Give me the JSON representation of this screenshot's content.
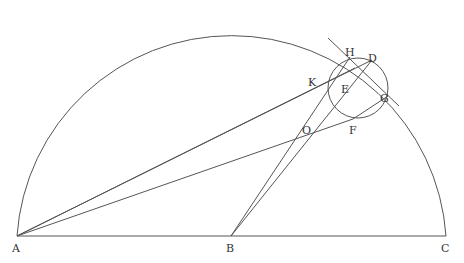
{
  "diagram": {
    "colors": {
      "stroke": "#555555",
      "label": "#333333",
      "background": "#ffffff"
    },
    "labels": {
      "A": "A",
      "B": "B",
      "C": "C",
      "D": "D",
      "E": "E",
      "F": "F",
      "G": "G",
      "H": "H",
      "K": "K",
      "O": "O"
    },
    "points": {
      "A": [
        17,
        236
      ],
      "B": [
        231,
        236
      ],
      "C": [
        446,
        236
      ],
      "D": [
        372,
        60
      ],
      "E": [
        346,
        88
      ],
      "F": [
        353,
        119
      ],
      "G": [
        388,
        96
      ],
      "H": [
        350,
        57
      ],
      "K": [
        330,
        80
      ],
      "O": [
        310,
        133
      ]
    },
    "semicircle": {
      "center": "B",
      "radius": 215
    },
    "small_circle": {
      "center": [
        358,
        88
      ],
      "radius": 30
    },
    "segments": [
      [
        "A",
        "C"
      ],
      [
        "A",
        "D"
      ],
      [
        "A",
        "K"
      ],
      [
        "A",
        "F"
      ],
      [
        "B",
        "H"
      ],
      [
        "B",
        "D"
      ],
      [
        "H",
        "G"
      ],
      [
        "K",
        "D"
      ]
    ]
  }
}
